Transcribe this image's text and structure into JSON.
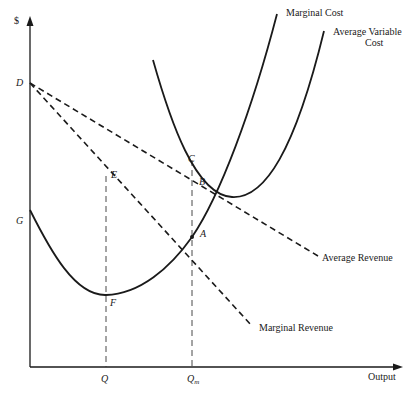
{
  "diagram": {
    "type": "economics-cost-revenue-diagram",
    "axes": {
      "y_label": "$",
      "x_label": "Output"
    },
    "curves": [
      {
        "id": "marginal-cost",
        "label": "Marginal Cost",
        "style": "solid"
      },
      {
        "id": "average-variable-cost",
        "label_line1": "Average Variable",
        "label_line2": "Cost",
        "style": "solid"
      },
      {
        "id": "average-revenue",
        "label": "Average Revenue",
        "style": "dashed"
      },
      {
        "id": "marginal-revenue",
        "label": "Marginal Revenue",
        "style": "dashed"
      }
    ],
    "points": {
      "D": "D",
      "G": "G",
      "E": "E",
      "F": "F",
      "C": "C",
      "B": "B",
      "A": "A"
    },
    "x_ticks": {
      "Q": "Q",
      "Qm_main": "Q",
      "Qm_sub": "m"
    }
  }
}
